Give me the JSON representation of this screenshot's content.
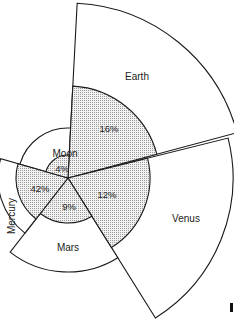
{
  "diagram": {
    "type": "polar-area-comparison",
    "center": [
      68,
      178
    ],
    "bodies": [
      {
        "name": "Earth",
        "percent": "16%",
        "start_deg": -87,
        "end_deg": -15,
        "outer_r": 175,
        "inner_r": 92
      },
      {
        "name": "Venus",
        "percent": "12%",
        "start_deg": -14,
        "end_deg": 58,
        "outer_r": 165,
        "inner_r": 82
      },
      {
        "name": "Mars",
        "percent": "9%",
        "start_deg": 58,
        "end_deg": 128,
        "outer_r": 94,
        "inner_r": 45
      },
      {
        "name": "Mercury",
        "percent": "42%",
        "start_deg": 128,
        "end_deg": 196,
        "outer_r": 70,
        "inner_r": 52
      },
      {
        "name": "Moon",
        "percent": "4%",
        "start_deg": 196,
        "end_deg": 273,
        "outer_r": 50,
        "inner_r": 23
      }
    ],
    "colors": {
      "stroke": "#1a1a1a",
      "fill_outer": "#ffffff",
      "fill_inner": "#d8d8d8"
    }
  }
}
